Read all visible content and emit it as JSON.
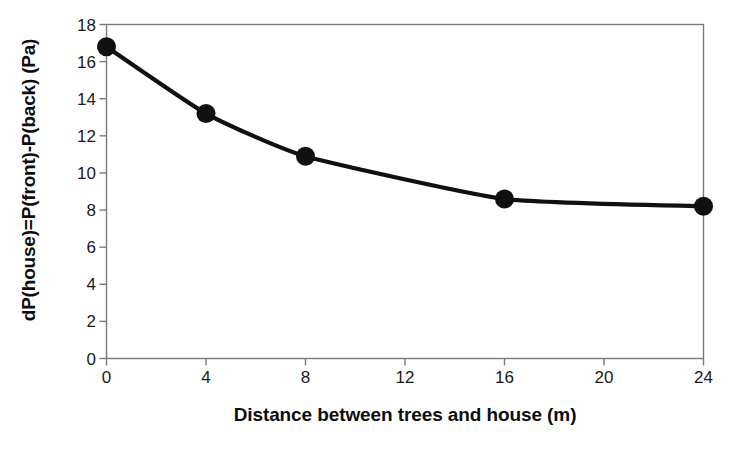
{
  "chart_data": {
    "type": "line",
    "title": "",
    "subtitle": "",
    "xlabel": "Distance between trees and house (m)",
    "ylabel": "dP(house)=P(front)-P(back) (Pa)",
    "x": [
      0,
      4,
      8,
      16,
      24
    ],
    "values": [
      16.8,
      13.2,
      10.9,
      8.6,
      8.2
    ],
    "series": [
      {
        "name": "dP(house)",
        "x": [
          0,
          4,
          8,
          16,
          24
        ],
        "values": [
          16.8,
          13.2,
          10.9,
          8.6,
          8.2
        ]
      }
    ],
    "xlim": [
      0,
      24
    ],
    "ylim": [
      0,
      18
    ],
    "xticks": [
      0,
      4,
      8,
      12,
      16,
      20,
      24
    ],
    "yticks": [
      0,
      2,
      4,
      6,
      8,
      10,
      12,
      14,
      16,
      18
    ],
    "xtick_labels": [
      "0",
      "4",
      "8",
      "12",
      "16",
      "20",
      "24"
    ],
    "ytick_labels": [
      "0",
      "2",
      "4",
      "6",
      "8",
      "10",
      "12",
      "14",
      "16",
      "18"
    ],
    "grid": false,
    "legend": false,
    "legend_position": "none",
    "marker": "filled-circle",
    "line_color": "#101010",
    "marker_color": "#101010",
    "frame_color": "#7a7a7a",
    "background_color": "#ffffff",
    "annotations": []
  }
}
